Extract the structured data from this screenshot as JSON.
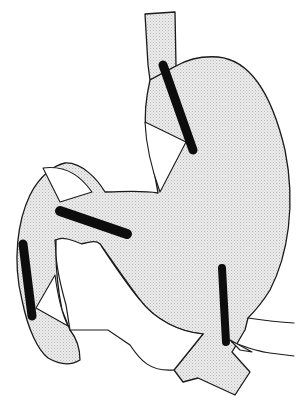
{
  "diagram": {
    "type": "anatomical-line-drawing",
    "colors": {
      "background": "#ffffff",
      "outline": "#1a1a1a",
      "fill": "#e4e4e4",
      "stipple": "#b8b8b8",
      "band": "#0d0d0d"
    },
    "parts": [
      {
        "id": "esophagus",
        "label": ""
      },
      {
        "id": "stomach-body",
        "label": ""
      },
      {
        "id": "duodenum-loop",
        "label": ""
      },
      {
        "id": "distal-limb",
        "label": ""
      },
      {
        "id": "outflow-tract",
        "label": ""
      }
    ],
    "bands": [
      {
        "id": "band-gastroesophageal",
        "x1": 163,
        "y1": 65,
        "x2": 193,
        "y2": 150,
        "width": 9
      },
      {
        "id": "band-duodenal",
        "x1": 60,
        "y1": 211,
        "x2": 127,
        "y2": 234,
        "width": 10
      },
      {
        "id": "band-limb",
        "x1": 23,
        "y1": 244,
        "x2": 32,
        "y2": 316,
        "width": 9
      },
      {
        "id": "band-pyloric",
        "x1": 222,
        "y1": 268,
        "x2": 226,
        "y2": 342,
        "width": 8
      }
    ]
  }
}
